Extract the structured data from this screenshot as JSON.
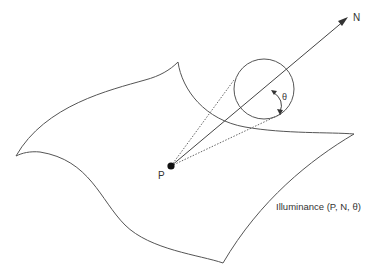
{
  "diagram": {
    "labels": {
      "point": "P",
      "normal": "N",
      "angle": "θ",
      "caption": "Illuminance (P, N, θ)"
    },
    "colors": {
      "stroke": "#555555",
      "text": "#333333",
      "background": "#ffffff"
    }
  }
}
